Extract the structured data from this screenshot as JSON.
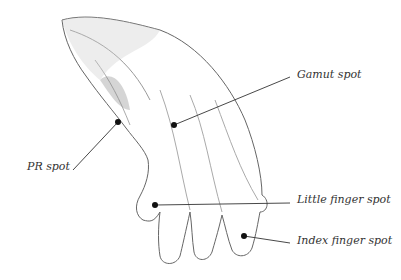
{
  "illustration": {
    "subject": "hand-drawing",
    "labels": [
      {
        "id": "gamut",
        "text": "Gamut spot",
        "x": 297,
        "y": 68
      },
      {
        "id": "pr",
        "text": "PR spot",
        "x": 27,
        "y": 161
      },
      {
        "id": "little",
        "text": "Little finger spot",
        "x": 297,
        "y": 193
      },
      {
        "id": "index",
        "text": "Index finger spot",
        "x": 297,
        "y": 234
      }
    ]
  }
}
